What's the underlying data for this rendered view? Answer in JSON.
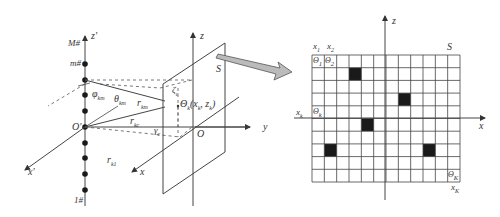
{
  "left_diagram": {
    "array_axis_label": "z′",
    "array_top_label": "M#",
    "array_element_label": "m#",
    "array_bottom_label": "1#",
    "origin_label": "O′",
    "x_prime_label": "x′",
    "phi_label": "φ",
    "phi_sub": "km",
    "theta_label": "θ",
    "theta_sub": "km",
    "r_km_label": "r",
    "r_km_sub": "km",
    "r_kc_label": "r",
    "r_kc_sub": "kc",
    "r_k1_label": "r",
    "r_k1_sub": "k1",
    "gamma_label": "γ",
    "gamma_sub": "c",
    "zeta_label": "ζ",
    "zeta_sub": "c",
    "point_label": "Θ",
    "point_sub": "k",
    "point_coords": "(x",
    "point_coords_sub1": "k",
    "point_coords_mid": ", z",
    "point_coords_sub2": "k",
    "point_coords_end": ")",
    "plane_label": "S",
    "z_axis_label": "z",
    "x_axis_label": "x",
    "y_axis_label": "y",
    "plane_origin_label": "O"
  },
  "right_diagram": {
    "plane_label": "S",
    "z_axis_label": "z",
    "x_axis_label": "x",
    "col_label_1": "x",
    "col_label_1_sub": "1",
    "col_label_2": "x",
    "col_label_2_sub": "2",
    "row_label": "x",
    "row_label_sub": "k",
    "last_label": "x",
    "last_label_sub": "K",
    "cell_1": "Θ",
    "cell_1_sub": "1",
    "cell_2": "Θ",
    "cell_2_sub": "2",
    "cell_k": "Θ",
    "cell_k_sub": "k",
    "cell_K": "Θ",
    "cell_K_sub": "K",
    "grid": {
      "cols": 12,
      "rows": 10
    },
    "filled_cells": [
      {
        "col": 3,
        "row": 1
      },
      {
        "col": 7,
        "row": 3
      },
      {
        "col": 4,
        "row": 5
      },
      {
        "col": 1,
        "row": 7
      },
      {
        "col": 9,
        "row": 7
      }
    ]
  },
  "colors": {
    "line": "#444444",
    "fill": "#1a1a1a",
    "arrow_fill": "#bbbbbb"
  }
}
